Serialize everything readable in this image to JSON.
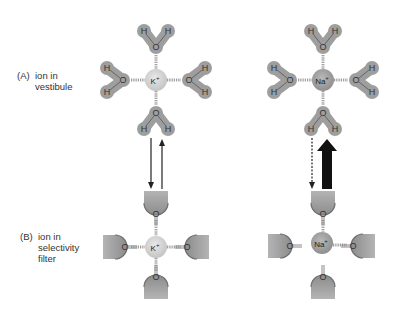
{
  "panels": {
    "a": {
      "tag": "(A)",
      "line1": "ion in",
      "line2": "vestibule"
    },
    "b": {
      "tag": "(B)",
      "line1": "ion in",
      "line2": "selectivity",
      "line3": "filter"
    }
  },
  "ions": {
    "potassium": "K",
    "sodium": "Na",
    "charge": "+"
  },
  "atoms": {
    "oxygen": "O",
    "hydrogen": "H"
  },
  "colors": {
    "water_halo": "#9e9e9e",
    "k_ion": "#d6d6d6",
    "na_ion": "#a8a8a8",
    "carbonyl_body": "#a0a0a0",
    "arrow": "#111111"
  },
  "arrows": {
    "potassium": {
      "down": "solid-thin",
      "up": "solid-thin",
      "meaning": "equilibrium"
    },
    "sodium": {
      "down": "dashed-thin",
      "up": "bold-thick",
      "meaning": "favored into vestibule"
    }
  }
}
